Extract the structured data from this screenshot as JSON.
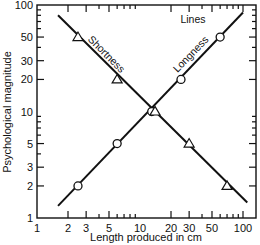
{
  "chart_data": {
    "type": "line",
    "title": "",
    "panel_label": "Lines",
    "xlabel": "Length produced in cm",
    "ylabel": "Psychological magnitude",
    "xscale": "log",
    "yscale": "log",
    "xlim": [
      1,
      100
    ],
    "ylim": [
      1,
      100
    ],
    "x_tick_labels": [
      "1",
      "2",
      "3",
      "5",
      "10",
      "20",
      "30",
      "50",
      "100"
    ],
    "y_tick_labels": [
      "1",
      "2",
      "3",
      "5",
      "10",
      "20",
      "30",
      "50",
      "100"
    ],
    "grid": false,
    "series": [
      {
        "name": "Longness",
        "marker": "circle",
        "points": [
          [
            2.5,
            2
          ],
          [
            6,
            5
          ],
          [
            13,
            10
          ],
          [
            25,
            20
          ],
          [
            60,
            50
          ]
        ],
        "fit_line": [
          [
            1.6,
            1.3
          ],
          [
            100,
            85
          ]
        ]
      },
      {
        "name": "Shortness",
        "marker": "triangle",
        "points": [
          [
            2.5,
            50
          ],
          [
            6,
            20
          ],
          [
            14,
            10
          ],
          [
            30,
            5
          ],
          [
            70,
            2
          ]
        ],
        "fit_line": [
          [
            1.6,
            80
          ],
          [
            110,
            1.4
          ]
        ]
      }
    ]
  }
}
